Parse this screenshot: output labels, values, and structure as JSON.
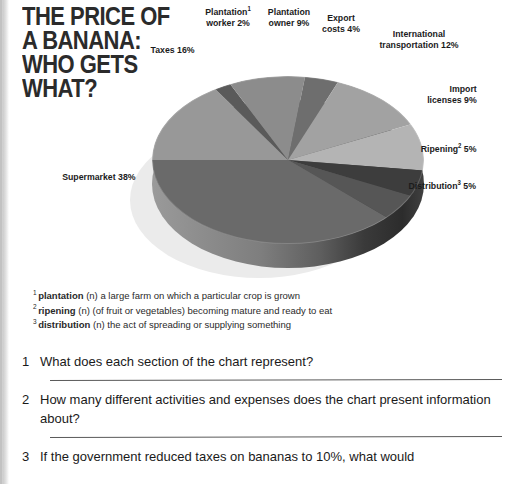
{
  "page": {
    "headline_lines": [
      "THE PRICE OF",
      "A BANANA:",
      "WHO GETS",
      "WHAT?"
    ]
  },
  "chart_data": {
    "type": "pie",
    "title": "THE PRICE OF A BANANA: WHO GETS WHAT?",
    "units": "percent",
    "legend": "labels placed around pie",
    "three_d": true,
    "categories": [
      "Supermarket",
      "Taxes",
      "Plantation worker",
      "Plantation owner",
      "Export costs",
      "International transportation",
      "Import licenses",
      "Ripening",
      "Distribution"
    ],
    "values": [
      38,
      16,
      2,
      9,
      4,
      12,
      9,
      5,
      5
    ],
    "slice_colors": [
      "#6a6a6a",
      "#989898",
      "#5a5a5a",
      "#8c8c8c",
      "#6e6e6e",
      "#a2a2a2",
      "#b4b4b4",
      "#3d3d3d",
      "#565656"
    ],
    "labels": [
      {
        "id": "supermarket",
        "text": "Supermarket 38%",
        "note": null
      },
      {
        "id": "taxes",
        "text": "Taxes 16%",
        "note": null
      },
      {
        "id": "pworker",
        "text": "Plantation",
        "text2": "worker 2%",
        "sup": "1"
      },
      {
        "id": "powner",
        "text": "Plantation",
        "text2": "owner 9%",
        "sup": null
      },
      {
        "id": "export",
        "text": "Export",
        "text2": "costs 4%",
        "sup": null
      },
      {
        "id": "intl",
        "text": "International",
        "text2": "transportation 12%",
        "sup": null
      },
      {
        "id": "import",
        "text": "Import",
        "text2": "licenses 9%",
        "sup": null
      },
      {
        "id": "ripening",
        "text": "Ripening",
        "text2": " 5%",
        "sup": "2"
      },
      {
        "id": "distribution",
        "text": "Distribution",
        "text2": " 5%",
        "sup": "3"
      }
    ]
  },
  "footnotes": [
    {
      "sup": "1",
      "term": "plantation",
      "definition": "(n) a large farm on which a particular crop is grown"
    },
    {
      "sup": "2",
      "term": "ripening",
      "definition": "(n) (of fruit or vegetables) becoming mature and ready to eat"
    },
    {
      "sup": "3",
      "term": "distribution",
      "definition": "(n) the act of spreading or supplying something"
    }
  ],
  "questions": [
    {
      "number": "1",
      "text": "What does each section of the chart represent?"
    },
    {
      "number": "2",
      "text": "How many different activities and expenses does the chart present information about?"
    },
    {
      "number": "3",
      "text": "If the government reduced taxes on bananas to 10%, what would"
    }
  ]
}
